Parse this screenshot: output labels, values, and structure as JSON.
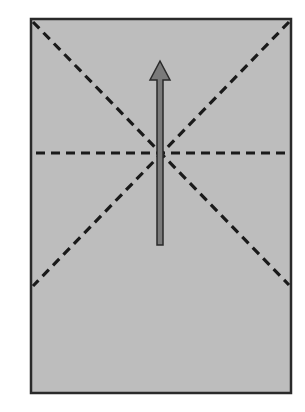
{
  "diagram": {
    "type": "origami-fold-diagram",
    "colors": {
      "background": "#ffffff",
      "paper_fill": "#bdbdbd",
      "paper_border": "#2a2a2a",
      "fold_line": "#1a1a1a",
      "arrow_fill": "#7a7a7a",
      "arrow_stroke": "#2a2a2a"
    },
    "paper": {
      "x": 31,
      "y": 19,
      "width": 260,
      "height": 374
    },
    "fold_lines": [
      {
        "name": "diagonal-top-left",
        "x1": 33,
        "y1": 22,
        "x2": 289,
        "y2": 285,
        "style": "valley-dashed"
      },
      {
        "name": "diagonal-top-right",
        "x1": 289,
        "y1": 22,
        "x2": 33,
        "y2": 286,
        "style": "valley-dashed"
      },
      {
        "name": "horizontal-center",
        "x1": 36,
        "y1": 153,
        "x2": 290,
        "y2": 153,
        "style": "valley-dashed"
      }
    ],
    "arrow": {
      "direction": "up",
      "tip": {
        "x": 160,
        "y": 61
      },
      "head_base_y": 80,
      "head_half_width": 10,
      "shaft_half_width": 3,
      "tail_y": 245
    }
  }
}
